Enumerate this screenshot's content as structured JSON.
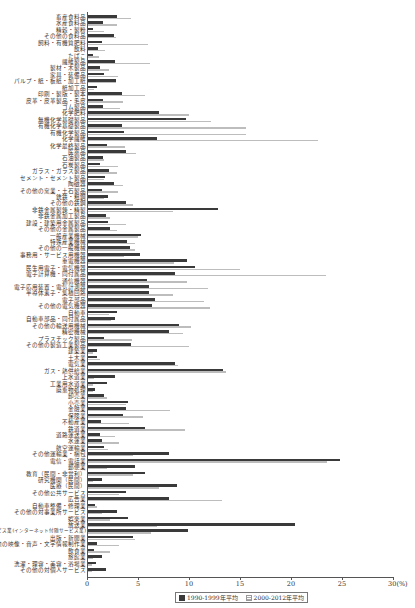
{
  "chart_data": {
    "type": "bar",
    "orientation": "horizontal",
    "title": "",
    "xlabel": "",
    "x_unit": "(%)",
    "ylabel": "",
    "xlim": [
      0,
      30
    ],
    "x_ticks": [
      "0",
      "5",
      "10",
      "15",
      "20",
      "25",
      "30"
    ],
    "grid": false,
    "legend_position": "bottom",
    "categories": [
      "畜産食料品",
      "水産食料品",
      "精穀・製粉",
      "その他の食料品",
      "飼料・有機質肥料",
      "飲料",
      "たばこ",
      "繊維製品",
      "製材・木製品",
      "家具・装備品",
      "パルプ・紙・板紙・加工紙",
      "紙加工品",
      "印刷・製版・製本",
      "皮革・皮革製品・毛皮",
      "ゴム製品",
      "化学肥料",
      "無機化学基礎製品",
      "有機化学基礎製品",
      "有機化学製品",
      "化学繊維",
      "化学最終製品",
      "医薬品",
      "石油製品",
      "石炭製品",
      "ガラス・ガラス製品",
      "セメント・セメント製品",
      "陶磁器",
      "その他の窯業・土石製品",
      "銑鉄・粗鋼",
      "その他の鉄鋼",
      "非鉄金属製錬・精製",
      "非鉄金属加工製品",
      "建設・建築用金属製品",
      "その他の金属製品",
      "一般産業機械",
      "特殊産業機械",
      "その他の一般機械",
      "事務用・サービス用機器",
      "重電機器",
      "民生用電子・電気機器",
      "電子計算機・同付属品",
      "通信機器",
      "電子応用装置・電気計測器",
      "半導体素子・集積回路",
      "電子部品",
      "その他の電気機器",
      "自動車",
      "自動車部品・同付属品",
      "その他の輸送用機械",
      "精密機械",
      "プラスチック製品",
      "その他の製造工業製品",
      "建築業",
      "土木業",
      "電気業",
      "ガス・熱供給業",
      "上水道業",
      "工業用水道業",
      "廃棄物処理",
      "卸売業",
      "小売業",
      "金融業",
      "保険業",
      "不動産業",
      "鉄道業",
      "道路運送業",
      "水運業",
      "航空運輸業",
      "その他運輸業・梱包",
      "電信・電話業",
      "郵便業",
      "教育（民間・非営利）",
      "研究機関（民間）",
      "医療（民間）",
      "その他公共サービス",
      "広告業",
      "自動車整備・修理業",
      "その他の対事業所サービス",
      "娯楽業",
      "放送業",
      "情報サービス業(インターネット付随サービス業)",
      "出版・新聞業",
      "その他の映像・音声・文字情報制作業",
      "飲食業",
      "旅館業",
      "洗濯・理容・美容・浴場業",
      "その他の対個人サービス"
    ],
    "series": [
      {
        "name": "1990-1999年平均",
        "color": "#3a3a3a",
        "values": [
          2.9,
          1.6,
          0.6,
          2.6,
          1.5,
          1.1,
          0.6,
          2.7,
          1.3,
          1.7,
          2.8,
          1.0,
          3.4,
          1.6,
          1.6,
          7.1,
          9.7,
          3.4,
          3.6,
          6.9,
          2.0,
          3.8,
          1.6,
          1.3,
          2.2,
          1.8,
          2.6,
          1.5,
          2.1,
          3.8,
          12.8,
          1.9,
          2.1,
          2.3,
          5.3,
          3.9,
          4.2,
          5.2,
          9.8,
          10.6,
          8.6,
          5.9,
          6.1,
          6.1,
          6.7,
          6.4,
          2.9,
          2.7,
          9.0,
          8.0,
          1.7,
          4.3,
          1.0,
          1.0,
          8.6,
          13.3,
          2.7,
          2.0,
          0.8,
          1.7,
          4.0,
          3.8,
          3.5,
          1.4,
          5.7,
          1.3,
          1.5,
          1.7,
          8.0,
          24.8,
          4.7,
          5.7,
          1.5,
          8.8,
          3.8,
          8.0,
          0.8,
          2.9,
          4.0,
          20.4,
          9.9,
          4.5,
          1.0,
          0.7,
          1.5,
          0.9,
          1.9
        ]
      },
      {
        "name": "2000-2012年平均",
        "color": "#bdbdbd",
        "values": [
          4.3,
          2.9,
          1.7,
          2.8,
          6.0,
          1.8,
          1.2,
          6.2,
          2.2,
          3.0,
          2.8,
          0.7,
          5.7,
          3.5,
          3.2,
          10.0,
          12.2,
          15.6,
          15.6,
          22.6,
          3.7,
          4.8,
          1.7,
          3.0,
          2.9,
          1.7,
          3.5,
          3.0,
          1.7,
          4.5,
          8.4,
          2.3,
          3.8,
          2.9,
          5.0,
          4.7,
          4.7,
          3.6,
          8.5,
          15.0,
          23.4,
          9.8,
          11.9,
          8.4,
          11.5,
          12.1,
          2.2,
          2.4,
          10.2,
          9.4,
          4.4,
          10.0,
          0.6,
          1.3,
          8.9,
          13.6,
          0.7,
          0.6,
          0.6,
          2.0,
          3.8,
          8.1,
          5.5,
          4.1,
          9.6,
          2.7,
          3.1,
          2.1,
          4.5,
          23.5,
          2.0,
          4.5,
          0.6,
          7.1,
          3.1,
          13.2,
          1.0,
          1.5,
          2.3,
          6.9,
          6.3,
          4.7,
          3.1,
          2.3,
          0.6,
          0.5,
          0.5
        ]
      }
    ]
  },
  "legend": {
    "series1_label": "1990-1999年平均",
    "series2_label": "2000-2012年平均"
  },
  "axis": {
    "unit_label": "30(%)"
  }
}
